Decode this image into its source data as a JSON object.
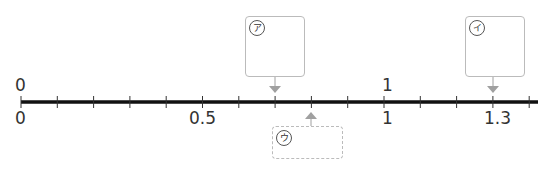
{
  "number_line": {
    "min": 0,
    "max": 1.4,
    "tick_step": 0.1,
    "line_color": "#111111",
    "arrow_color": "#a0a0a0",
    "labels_above": [
      {
        "value": 0,
        "text": "0"
      },
      {
        "value": 1,
        "text": "1"
      }
    ],
    "labels_below": [
      {
        "value": 0,
        "text": "0"
      },
      {
        "value": 0.5,
        "text": "0.5"
      },
      {
        "value": 1,
        "text": "1"
      },
      {
        "value": 1.3,
        "text": "1.3"
      }
    ]
  },
  "boxes": [
    {
      "id": "a",
      "label": "ア",
      "points_to": 0.7,
      "style": "solid",
      "position": "above"
    },
    {
      "id": "i",
      "label": "イ",
      "points_to": 1.3,
      "style": "solid",
      "position": "above"
    },
    {
      "id": "u",
      "label": "ウ",
      "points_to": 0.8,
      "style": "dashed",
      "position": "below"
    }
  ]
}
